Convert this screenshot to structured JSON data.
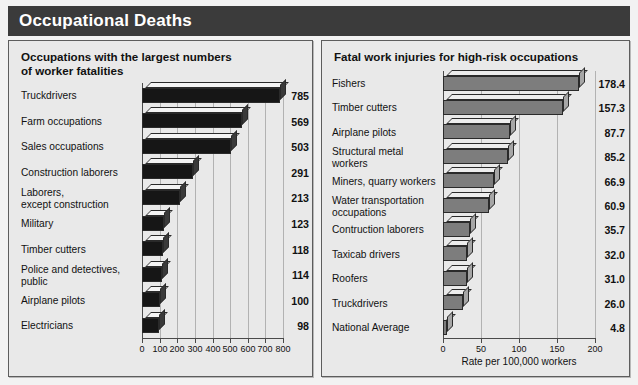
{
  "header": {
    "title": "Occupational Deaths"
  },
  "panels": {
    "left": {
      "title": "Occupations with the largest numbers\nof worker fatalities",
      "axis_caption": ""
    },
    "right": {
      "title": "Fatal work injuries for high-risk occupations",
      "axis_caption": "Rate per 100,000 workers"
    }
  },
  "chart_data": [
    {
      "type": "bar",
      "orientation": "horizontal",
      "title": "Occupations with the largest numbers of worker fatalities",
      "xlabel": "",
      "ylabel": "",
      "xlim": [
        0,
        800
      ],
      "ticks": [
        0,
        100,
        200,
        300,
        400,
        500,
        600,
        700,
        800
      ],
      "tick_labels": [
        "0",
        "100",
        "200",
        "300",
        "400",
        "500",
        "600",
        "700",
        "800"
      ],
      "grid": true,
      "legend": "none",
      "bar_color": "#161616",
      "categories": [
        "Truckdrivers",
        "Farm occupations",
        "Sales occupations",
        "Construction laborers",
        "Laborers,\nexcept construction",
        "Military",
        "Timber cutters",
        "Police and detectives,\npublic",
        "Airplane pilots",
        "Electricians"
      ],
      "values": [
        785,
        569,
        503,
        291,
        213,
        123,
        118,
        114,
        100,
        98
      ],
      "value_labels": [
        "785",
        "569",
        "503",
        "291",
        "213",
        "123",
        "118",
        "114",
        "100",
        "98"
      ]
    },
    {
      "type": "bar",
      "orientation": "horizontal",
      "title": "Fatal work injuries for high-risk occupations",
      "xlabel": "Rate per 100,000 workers",
      "ylabel": "",
      "xlim": [
        0,
        200
      ],
      "ticks": [
        0,
        50,
        100,
        150,
        200
      ],
      "tick_labels": [
        "0",
        "50",
        "100",
        "150",
        "200"
      ],
      "grid": true,
      "legend": "none",
      "bar_color": "#7d7d7d",
      "categories": [
        "Fishers",
        "Timber cutters",
        "Airplane pilots",
        "Structural metal\nworkers",
        "Miners, quarry workers",
        "Water transportation\noccupations",
        "Contruction laborers",
        "Taxicab drivers",
        "Roofers",
        "Truckdrivers",
        "National Average"
      ],
      "values": [
        178.4,
        157.3,
        87.7,
        85.2,
        66.9,
        60.9,
        35.7,
        32.0,
        31.0,
        26.0,
        4.8
      ],
      "value_labels": [
        "178.4",
        "157.3",
        "87.7",
        "85.2",
        "66.9",
        "60.9",
        "35.7",
        "32.0",
        "31.0",
        "26.0",
        "4.8"
      ]
    }
  ]
}
